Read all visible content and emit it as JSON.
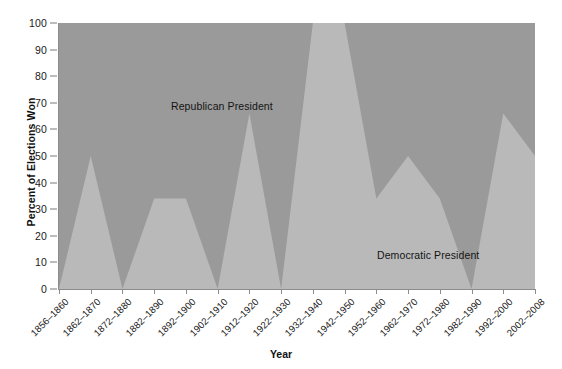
{
  "chart_data": {
    "type": "area",
    "title": "",
    "xlabel": "Year",
    "ylabel": "Percent of Elections Won",
    "ylim": [
      0,
      100
    ],
    "xlim_categories": 16,
    "grid": false,
    "stacked": true,
    "yticks": [
      0,
      10,
      20,
      30,
      40,
      50,
      60,
      70,
      80,
      90,
      100
    ],
    "ytick_labels": [
      "0",
      "10",
      "20",
      "30",
      "40",
      "50",
      "60",
      "70",
      "80",
      "90",
      "100"
    ],
    "categories": [
      "1856–1860",
      "1862–1870",
      "1872–1880",
      "1882–1890",
      "1892–1900",
      "1902–1910",
      "1912–1920",
      "1922–1930",
      "1932–1940",
      "1942–1950",
      "1952–1960",
      "1962–1970",
      "1972–1980",
      "1982–1990",
      "1992–2000",
      "2002–2008"
    ],
    "series": [
      {
        "name": "Democratic President",
        "color": "#b9b9b9",
        "values": [
          0,
          50,
          0,
          34,
          34,
          0,
          66,
          0,
          100,
          100,
          34,
          50,
          34,
          0,
          66,
          50
        ]
      },
      {
        "name": "Republican President",
        "color": "#9a9a9a",
        "values": [
          100,
          50,
          100,
          66,
          66,
          100,
          34,
          100,
          0,
          0,
          66,
          50,
          66,
          100,
          34,
          50
        ]
      }
    ],
    "annotations": [
      {
        "text": "Republican President",
        "x_category": "1882–1890",
        "y": 78
      },
      {
        "text": "Democratic President",
        "x_category": "1952–1960",
        "y": 22
      }
    ],
    "legend": "inline-annotations",
    "colors": {
      "republican": "#9a9a9a",
      "democratic": "#b9b9b9",
      "axis": "#8c8c8c",
      "text": "#1a1a1a",
      "background": "#ffffff"
    }
  }
}
